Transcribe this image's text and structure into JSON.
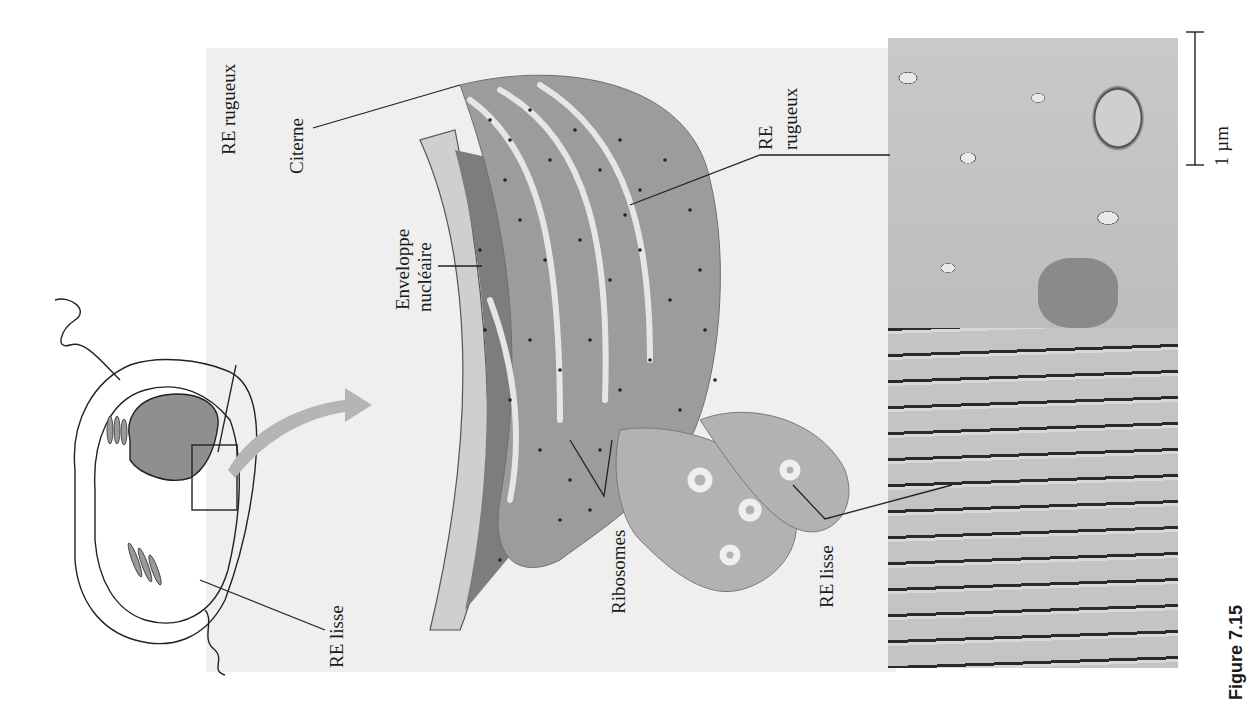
{
  "figure": {
    "caption_label": "Figure 7.15",
    "orientation": "rotated 90° counter-clockwise",
    "colors": {
      "panel_background": "#efefef",
      "membrane_fill": "#9c9c9c",
      "nucleus_fill": "#7a7a7a",
      "ribosome_dot": "#222222",
      "arrow_fill": "#b5b5b5"
    }
  },
  "cell_diagram": {
    "labels": {
      "rough_er": "RE rugueux",
      "smooth_er": "RE lisse"
    }
  },
  "er_illustration": {
    "labels": {
      "cisterna": "Citerne",
      "nuclear_envelope_line1": "Enveloppe",
      "nuclear_envelope_line2": "nucléaire",
      "rough_er_line1": "RE",
      "rough_er_line2": "rugueux",
      "ribosomes": "Ribosomes",
      "smooth_er": "RE lisse"
    }
  },
  "micrograph": {
    "scale_bar_label": "1 µm"
  }
}
